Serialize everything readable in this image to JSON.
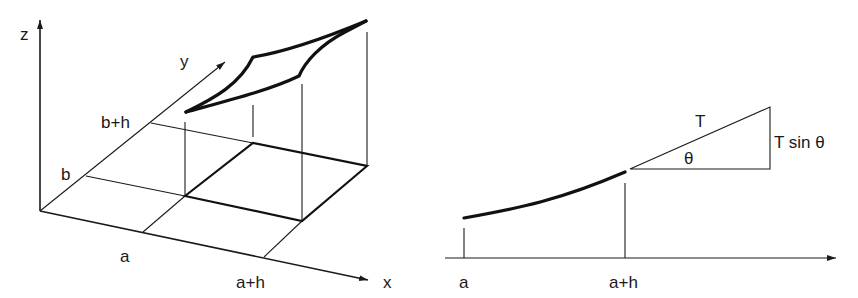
{
  "left_figure": {
    "title": "3D surface over square region",
    "axes": {
      "z_label": "z",
      "y_label": "y",
      "x_label": "x"
    },
    "y_ticks": [
      {
        "label": "b"
      },
      {
        "label": "b+h"
      }
    ],
    "x_ticks": [
      {
        "label": "a"
      },
      {
        "label": "a+h"
      }
    ]
  },
  "right_figure": {
    "title": "String segment with tension",
    "x_ticks": [
      {
        "label": "a"
      },
      {
        "label": "a+h"
      }
    ],
    "triangle": {
      "hypotenuse_label": "T",
      "angle_label": "θ",
      "vertical_label": "T sin θ"
    }
  },
  "colors": {
    "line": "#1a1a1a",
    "background": "#ffffff"
  }
}
